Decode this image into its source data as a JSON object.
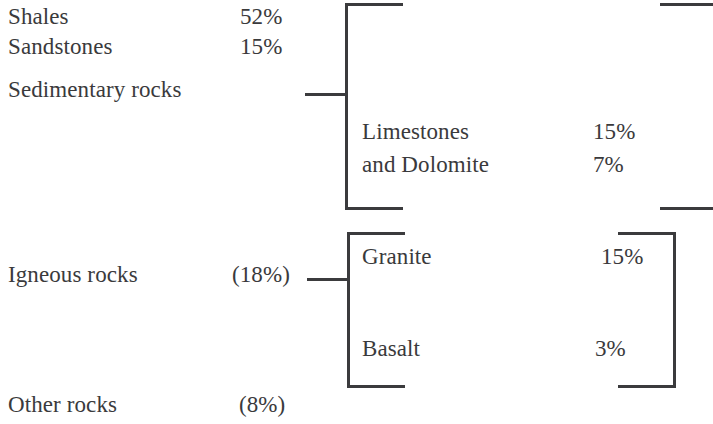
{
  "diagram": {
    "type": "bracket-hierarchy",
    "ink_color": "#3b3b3d",
    "text_color": "#3a3a3c",
    "background_color": "#ffffff",
    "groups": [
      {
        "id": "sedimentary",
        "label": "Sedimentary rocks",
        "share": "",
        "members": [
          {
            "name": "Shales",
            "value": "52%"
          },
          {
            "name": "Sandstones",
            "value": "15%"
          },
          {
            "name": "Limestones",
            "value": "15%"
          },
          {
            "name": "and Dolomite",
            "value": "7%"
          }
        ]
      },
      {
        "id": "igneous",
        "label": "Igneous rocks",
        "share": "(18%)",
        "members": [
          {
            "name": "Granite",
            "value": "15%"
          },
          {
            "name": "Basalt",
            "value": "3%"
          }
        ]
      },
      {
        "id": "other",
        "label": "Other rocks",
        "share": "(8%)",
        "members": []
      }
    ]
  },
  "chart_data": {
    "type": "table",
    "categories": [
      "Shales",
      "Sandstones",
      "Limestones",
      "and Dolomite",
      "Granite",
      "Basalt",
      "Igneous rocks",
      "Other rocks"
    ],
    "values": [
      52,
      15,
      15,
      7,
      15,
      3,
      18,
      8
    ],
    "labels": [
      "52%",
      "15%",
      "15%",
      "7%",
      "15%",
      "3%",
      "(18%)",
      "(8%)"
    ],
    "groups": [
      {
        "name": "Sedimentary rocks",
        "members": [
          "Shales",
          "Sandstones",
          "Limestones",
          "and Dolomite"
        ],
        "member_values": [
          52,
          15,
          15,
          7
        ]
      },
      {
        "name": "Igneous rocks",
        "share": 18,
        "members": [
          "Granite",
          "Basalt"
        ],
        "member_values": [
          15,
          3
        ]
      },
      {
        "name": "Other rocks",
        "share": 8,
        "members": [],
        "member_values": []
      }
    ],
    "xlabel": "",
    "ylabel": "Percent",
    "grid": false,
    "legend": "none"
  }
}
